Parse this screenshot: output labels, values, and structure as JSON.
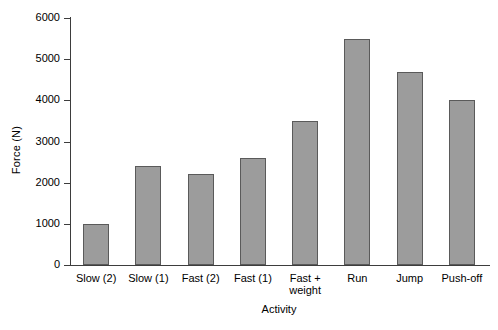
{
  "chart_data": {
    "type": "bar",
    "title": "",
    "xlabel": "Activity",
    "ylabel": "Force (N)",
    "categories": [
      "Slow (2)",
      "Slow (1)",
      "Fast (2)",
      "Fast (1)",
      "Fast +\nweight",
      "Run",
      "Jump",
      "Push-off"
    ],
    "values": [
      1000,
      2400,
      2200,
      2600,
      3500,
      5500,
      4700,
      4000
    ],
    "ylim": [
      0,
      6000
    ],
    "yticks": [
      0,
      1000,
      2000,
      3000,
      4000,
      5000,
      6000
    ],
    "ytick_labels": [
      "0",
      "1000",
      "2000",
      "3000",
      "4000",
      "5000",
      "6000"
    ],
    "grid": false,
    "legend": null,
    "bar_color": "#9c9c9c",
    "bar_edge_color": "#5a5a5a",
    "axis_color": "#3d3d3d",
    "background": "#ffffff"
  }
}
